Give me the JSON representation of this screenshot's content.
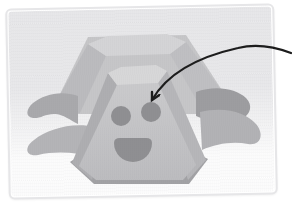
{
  "image": {
    "description": "Cartoon illustration of a smiling gray boulder creature shaped like two stacked truncated pyramids with four flippers, shown on a light framed card; a hand-drawn black arrow curves in from the right edge and points at the creature's right eye"
  },
  "card": {
    "background": "#ffffff",
    "border_color": "#e6e6e8",
    "backdrop_top_color": "#eaeaec",
    "backdrop_bottom_color": "#ffffff"
  },
  "creature": {
    "rear_body_color": "#c6c6c8",
    "rear_left_facet_color": "#bbbbbe",
    "rear_right_facet_color": "#bfbfc2",
    "rear_top_color": "#d4d4d6",
    "front_top_color": "#d7d7d8",
    "front_face_color": "#c9c9cb",
    "front_face_bottom_color": "#bcbcbf",
    "front_left_facet_color": "#aeaeb1",
    "front_right_facet_color": "#b6b6b9",
    "base_color": "#a2a2a5",
    "flipper_upper_left_color": "#a9a9ac",
    "flipper_lower_left_color": "#b4b4b7",
    "flipper_upper_right_color": "#9d9da0",
    "flipper_lower_right_color": "#b2b2b5",
    "feature_color": "#8f8f92"
  },
  "annotation": {
    "arrow_color": "#1c1c1c",
    "points_to": "right-eye"
  }
}
